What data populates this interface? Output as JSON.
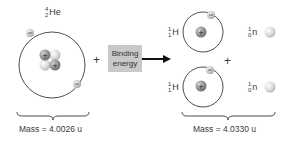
{
  "reactant": {
    "label": {
      "mass_number": "4",
      "atomic_number": "2",
      "symbol": "He"
    },
    "mass_label": "Mass = 4.0026 u"
  },
  "operator_plus_1": "+",
  "binding_energy": {
    "line1": "Binding",
    "line2": "energy"
  },
  "products": {
    "hydrogen_top": {
      "mass_number": "1",
      "atomic_number": "1",
      "symbol": "H"
    },
    "neutron_top": {
      "mass_number": "1",
      "atomic_number": "0",
      "symbol": "n"
    },
    "hydrogen_bottom": {
      "mass_number": "1",
      "atomic_number": "1",
      "symbol": "H"
    },
    "neutron_bottom": {
      "mass_number": "1",
      "atomic_number": "0",
      "symbol": "n"
    },
    "mass_label": "Mass = 4.0330 u"
  },
  "operator_plus_2": "+",
  "colors": {
    "orbit": "#3a3a3a",
    "proton": "#8a8a8a",
    "neutron": "#d8d8d8",
    "electron": "#c4c4c4",
    "box": "#c9c9c9"
  }
}
